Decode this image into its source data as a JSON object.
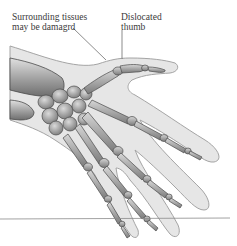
{
  "figure": {
    "labels": {
      "tissues": {
        "line1": "Surrounding tissues",
        "line2": "may be damagrd"
      },
      "thumb": {
        "line1": "Dislocated",
        "line2": "thumb"
      }
    },
    "colors": {
      "bone_fill": "#b8b8b8",
      "bone_stroke": "#4a4a4a",
      "tissue_fill": "#e4e4e4",
      "tissue_stroke": "#9a9a9a",
      "label_text": "#3a3a3a",
      "leader_line": "#5a5a5a",
      "rule": "#8a8a8a"
    }
  }
}
